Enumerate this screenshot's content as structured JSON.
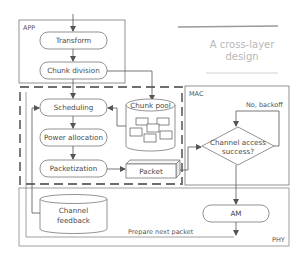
{
  "title": {
    "line1": "A cross-layer",
    "line2": "design"
  },
  "layers": {
    "app": "APP",
    "mac": "MAC",
    "phy": "PHY"
  },
  "nodes": {
    "transform": "Transform",
    "chunk_division": "Chunk division",
    "scheduling": "Scheduling",
    "power_allocation": "Power allocation",
    "packetization": "Packetization",
    "chunk_pool": "Chunk pool",
    "packet": "Packet",
    "channel_access_line1": "Channel access",
    "channel_access_line2": "success?",
    "am": "AM",
    "channel_feedback_line1": "Channel",
    "channel_feedback_line2": "feedback"
  },
  "edges": {
    "no_backoff": "No, backoff",
    "prepare_next_packet": "Prepare next packet"
  },
  "colors": {
    "stroke": "#6b6b6b",
    "dashed": "#6e6e6e",
    "title_text": "#b8b8b8",
    "text": "#4a4a4a"
  }
}
